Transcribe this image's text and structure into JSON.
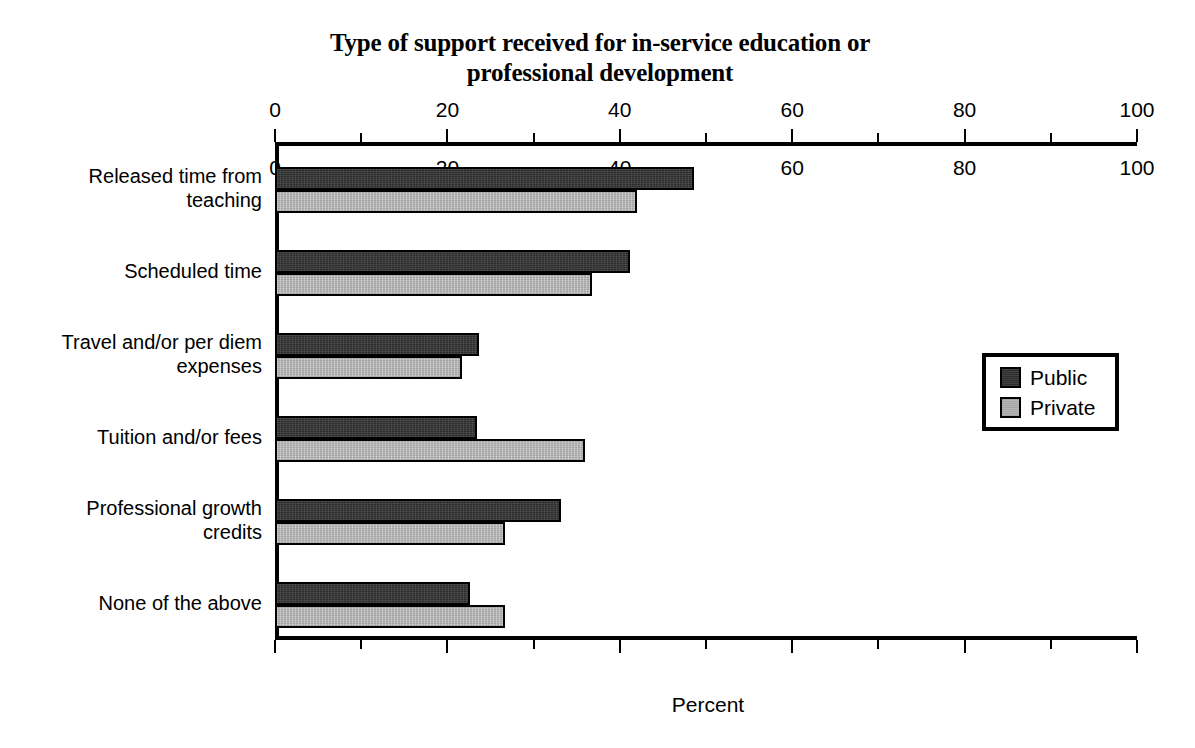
{
  "chart_data": {
    "type": "bar",
    "orientation": "horizontal",
    "title": "Type of support received for in-service education or professional development",
    "title_lines": [
      "Type of support received for in-service education or",
      "professional development"
    ],
    "xlabel": "Percent",
    "ylabel": "",
    "xlim": [
      0,
      100
    ],
    "xticks": [
      0,
      20,
      40,
      60,
      80,
      100
    ],
    "xtick_labels": [
      "0",
      "20",
      "40",
      "60",
      "80",
      "100"
    ],
    "xminor_ticks": [
      10,
      30,
      50,
      70,
      90
    ],
    "axis_top": true,
    "axis_bottom": true,
    "grid": false,
    "legend_position": "center-right",
    "categories": [
      "Released time from\nteaching",
      "Scheduled time",
      "Travel and/or per diem\nexpenses",
      "Tuition and/or fees",
      "Professional growth\ncredits",
      "None of the above"
    ],
    "series": [
      {
        "name": "Public",
        "color": "#2d2d2d",
        "values": [
          48.4,
          40.9,
          23.4,
          23.2,
          33.0,
          22.4
        ]
      },
      {
        "name": "Private",
        "color": "#b7b7b7",
        "values": [
          41.8,
          36.5,
          21.5,
          35.7,
          26.5,
          26.5
        ]
      }
    ]
  },
  "legend": {
    "items": [
      {
        "label": "Public",
        "swatch": "public"
      },
      {
        "label": "Private",
        "swatch": "private"
      }
    ]
  }
}
